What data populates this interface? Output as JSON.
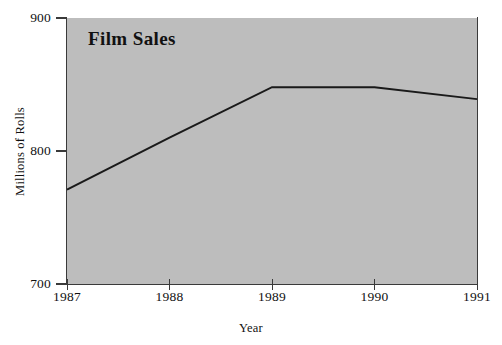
{
  "chart_data": {
    "type": "line",
    "title": "Film Sales",
    "xlabel": "Year",
    "ylabel": "Millions of Rolls",
    "categories": [
      "1987",
      "1988",
      "1989",
      "1990",
      "1991"
    ],
    "x": [
      1987,
      1988,
      1989,
      1990,
      1991
    ],
    "values": [
      771,
      810,
      848,
      848,
      839
    ],
    "series": [
      {
        "name": "Film Sales",
        "values": [
          771,
          810,
          848,
          848,
          839
        ]
      }
    ],
    "xlim": [
      1987,
      1991
    ],
    "ylim": [
      700,
      900
    ],
    "y_ticks": [
      700,
      800,
      900
    ],
    "y_tick_labels": [
      "700",
      "800",
      "900"
    ],
    "x_ticks": [
      1987,
      1988,
      1989,
      1990,
      1991
    ],
    "x_tick_labels": [
      "1987",
      "1988",
      "1989",
      "1990",
      "1991"
    ],
    "grid": false,
    "legend": false,
    "legend_position": "none",
    "plot_background_color": "#bdbdbd",
    "figure_background_color": "#ffffff",
    "line_color": "#1a1a1a",
    "axis_color": "#3a3a3a"
  }
}
